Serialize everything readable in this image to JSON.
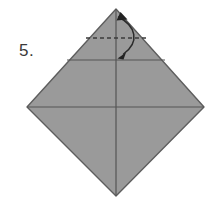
{
  "figure": {
    "kind": "origami-instruction-diagram",
    "step_label": "5.",
    "background_color": "#ffffff",
    "paper_fill": "#9a9a9a",
    "paper_edge_color": "#5e5e5e",
    "crease_line_color": "#555555",
    "fold_line_color": "#3b3b3b",
    "arrow_color": "#2b2b2b"
  },
  "shape": {
    "name": "diamond",
    "description": "square sheet rotated 45 degrees",
    "vertices": {
      "top": [
        116,
        9
      ],
      "right": [
        204,
        107
      ],
      "bottom": [
        116,
        196
      ],
      "left": [
        27,
        107
      ]
    }
  },
  "creases": [
    {
      "name": "vertical-center-crease",
      "style": "solid",
      "from": [
        116,
        9
      ],
      "to": [
        116,
        196
      ]
    },
    {
      "name": "horizontal-center-crease",
      "style": "solid",
      "from": [
        27,
        107
      ],
      "to": [
        204,
        107
      ]
    },
    {
      "name": "upper-horizontal-crease",
      "style": "solid",
      "from": [
        67,
        60
      ],
      "to": [
        165,
        60
      ]
    }
  ],
  "fold_lines": [
    {
      "name": "dashed-fold-line",
      "style": "dashed",
      "from": [
        86,
        38
      ],
      "to": [
        146,
        38
      ],
      "dash_pattern": "4 3"
    }
  ],
  "arrows": [
    {
      "name": "fold-unfold-arrow",
      "style": "curved-double-headed",
      "meaning": "fold down then unfold",
      "start": [
        118,
        16
      ],
      "end": [
        122,
        56
      ],
      "control": [
        143,
        34
      ],
      "head_top_direction": "up-right",
      "head_bottom_direction": "down-left"
    }
  ]
}
